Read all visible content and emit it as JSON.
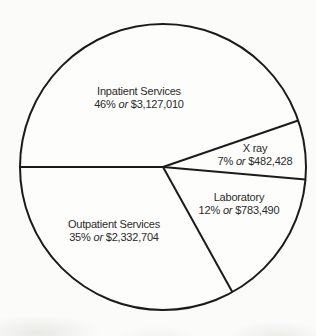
{
  "chart_data": {
    "type": "pie",
    "legend": "none",
    "labels_position": "inside",
    "slices": [
      {
        "label": "Inpatient Services",
        "percent_label": "46%",
        "connector": "or",
        "amount_label": "$3,127,010",
        "percent": 46,
        "value": 3127010
      },
      {
        "label": "X ray",
        "percent_label": "7%",
        "connector": "or",
        "amount_label": "$482,428",
        "percent": 7,
        "value": 482428
      },
      {
        "label": "Laboratory",
        "percent_label": "12%",
        "connector": "or",
        "amount_label": "$783,490",
        "percent": 12,
        "value": 783490
      },
      {
        "label": "Outpatient Services",
        "percent_label": "35%",
        "connector": "or",
        "amount_label": "$2,332,704",
        "percent": 35,
        "value": 2332704
      }
    ],
    "layout": {
      "center_x": 163,
      "center_y": 167,
      "radius": 143,
      "boundary_angles_deg": [
        180,
        19,
        -5,
        -61
      ],
      "direction": "clockwise",
      "stroke_color": "#1b1b1b",
      "stroke_width": 2,
      "fill_color": "#fdfdfb",
      "text_color": "#2a2a2a",
      "background_color": "#fbfbf9"
    }
  }
}
